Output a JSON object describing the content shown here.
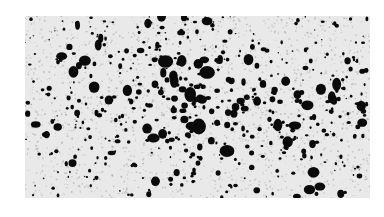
{
  "image": {
    "description": "Grayscale micrograph-like texture of dense irregular black specks on a light gray background, denser toward the center",
    "background_color": "#e9e9e9",
    "speck_color": "#0a0a0a",
    "frame": {
      "x": 25,
      "y": 16,
      "width": 345,
      "height": 182
    }
  }
}
